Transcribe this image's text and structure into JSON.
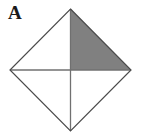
{
  "figure": {
    "label": "A",
    "caption_label": "A",
    "background_color": "#ffffff",
    "shape_name": "square-rotated-45-diamond",
    "outline_color": "#4a4a4a",
    "outline_width": 1.2,
    "diagonal_color": "#707070",
    "diagonal_width": 1.3,
    "shaded_region_color": "#808080",
    "shaded_region_name": "upper-right-quadrant-triangle",
    "unshaded_region_color": "#ffffff",
    "vertices": {
      "top": [
        70.5,
        9
      ],
      "right": [
        131,
        70
      ],
      "bottom": [
        70.5,
        131
      ],
      "left": [
        10,
        70
      ],
      "center": [
        70.5,
        70
      ]
    },
    "diagonals": [
      {
        "name": "vertical-diagonal",
        "from": [
          70.5,
          9
        ],
        "to": [
          70.5,
          131
        ]
      },
      {
        "name": "horizontal-diagonal",
        "from": [
          10,
          70
        ],
        "to": [
          131,
          70
        ]
      }
    ],
    "shaded_triangle_points": [
      [
        70.5,
        9
      ],
      [
        131,
        70
      ],
      [
        70.5,
        70
      ]
    ],
    "quadrant_fills": {
      "upper_left": "#ffffff",
      "upper_right": "#808080",
      "lower_left": "#ffffff",
      "lower_right": "#ffffff"
    }
  }
}
